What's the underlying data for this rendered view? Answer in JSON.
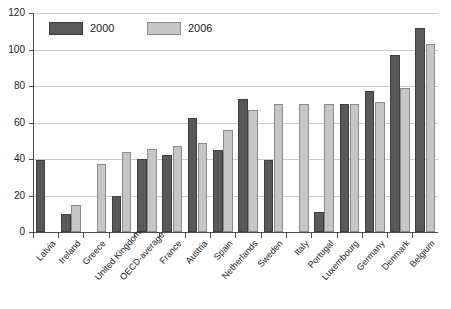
{
  "chart_data": {
    "type": "bar",
    "title": "",
    "subtitle": "",
    "xlabel": "",
    "ylabel": "",
    "ylim": [
      0,
      120
    ],
    "ytick_step": 20,
    "yticks": [
      "0",
      "20",
      "40",
      "60",
      "80",
      "100",
      "120"
    ],
    "grid": true,
    "legend_position": "top-left",
    "categories": [
      "Latvia",
      "Ireland",
      "Greece",
      "United Kingdom",
      "OECD-average",
      "France",
      "Austria",
      "Spain",
      "Netherlands",
      "Sweden",
      "Italy",
      "Portugal",
      "Luxembourg",
      "Germany",
      "Denmark",
      "Belgium"
    ],
    "series": [
      {
        "name": "2000",
        "color": "#595959",
        "values": [
          39.5,
          10,
          null,
          19.5,
          40,
          42,
          62.5,
          45,
          73,
          39.5,
          null,
          11,
          70,
          77,
          97,
          112
        ]
      },
      {
        "name": "2006",
        "color": "#c6c6c6",
        "values": [
          null,
          15,
          37.5,
          44,
          45.5,
          47,
          49,
          56,
          67,
          70,
          70,
          70,
          70,
          71,
          79,
          103
        ]
      }
    ]
  },
  "legend": {
    "items": [
      {
        "label": "2000",
        "color": "#595959"
      },
      {
        "label": "2006",
        "color": "#c6c6c6"
      }
    ]
  }
}
